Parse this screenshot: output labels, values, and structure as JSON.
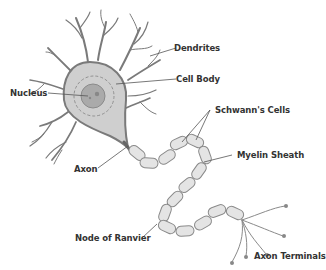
{
  "diagram": {
    "colors": {
      "outline": "#7a7a7a",
      "cell_fill": "#cfcfcf",
      "nucleus_fill": "#aaaaaa",
      "myelin_fill": "#e4e4e4",
      "label_text": "#333333",
      "leader_line": "#555555"
    },
    "labels": {
      "dendrites": "Dendrites",
      "cell_body": "Cell Body",
      "nucleus": "Nucleus",
      "schwanns_cells": "Schwann's Cells",
      "axon": "Axon",
      "myelin_sheath": "Myelin Sheath",
      "node_of_ranvier": "Node of Ranvier",
      "axon_terminals": "Axon Terminals"
    }
  }
}
